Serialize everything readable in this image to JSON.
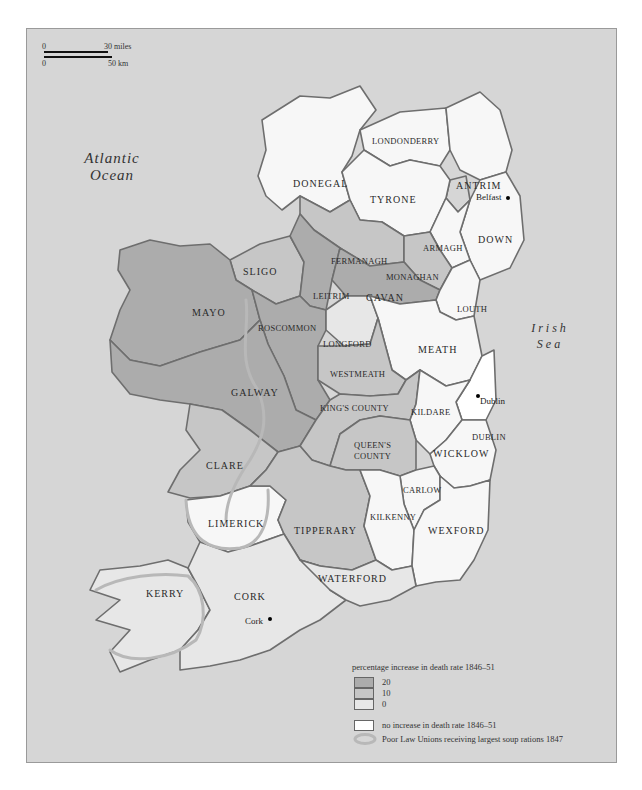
{
  "page_number": "",
  "scale_bar": {
    "zero_top": "0",
    "miles": "30 miles",
    "zero_bottom": "0",
    "km": "50 km"
  },
  "water": {
    "atlantic": "Atlantic Ocean",
    "atlantic_line1": "Atlantic",
    "atlantic_line2": "Ocean",
    "irish_line1": "Irish",
    "irish_line2": "Sea"
  },
  "colors": {
    "sea": "#d6d6d6",
    "level_20": "#acacac",
    "level_10": "#c6c6c6",
    "level_0": "#e7e7e7",
    "no_increase": "#f7f7f7",
    "border": "#6e6e6e",
    "soup_outline": "#b8b8b8"
  },
  "counties": [
    {
      "name": "DONEGAL",
      "level": "no increase"
    },
    {
      "name": "LONDONDERRY",
      "level": "no increase"
    },
    {
      "name": "ANTRIM",
      "level": "no increase"
    },
    {
      "name": "TYRONE",
      "level": "no increase"
    },
    {
      "name": "DOWN",
      "level": "no increase"
    },
    {
      "name": "ARMAGH",
      "level": "no increase"
    },
    {
      "name": "FERMANAGH",
      "level": "10"
    },
    {
      "name": "MONAGHAN",
      "level": "10"
    },
    {
      "name": "SLIGO",
      "level": "10"
    },
    {
      "name": "LEITRIM",
      "level": "20"
    },
    {
      "name": "CAVAN",
      "level": "20"
    },
    {
      "name": "MAYO",
      "level": "20"
    },
    {
      "name": "ROSCOMMON",
      "level": "20"
    },
    {
      "name": "LOUTH",
      "level": "no increase"
    },
    {
      "name": "LONGFORD",
      "level": "0"
    },
    {
      "name": "MEATH",
      "level": "no increase"
    },
    {
      "name": "WESTMEATH",
      "level": "10"
    },
    {
      "name": "GALWAY",
      "level": "20"
    },
    {
      "name": "DUBLIN",
      "level": "no increase"
    },
    {
      "name": "KING'S COUNTY",
      "level": "10"
    },
    {
      "name": "KILDARE",
      "level": "no increase"
    },
    {
      "name": "CLARE",
      "level": "10"
    },
    {
      "name": "QUEEN'S COUNTY",
      "level": "10"
    },
    {
      "name": "WICKLOW",
      "level": "no increase"
    },
    {
      "name": "CARLOW",
      "level": "no increase"
    },
    {
      "name": "LIMERICK",
      "level": "no increase"
    },
    {
      "name": "TIPPERARY",
      "level": "10"
    },
    {
      "name": "KILKENNY",
      "level": "no increase"
    },
    {
      "name": "WEXFORD",
      "level": "no increase"
    },
    {
      "name": "KERRY",
      "level": "0"
    },
    {
      "name": "CORK",
      "level": "0"
    },
    {
      "name": "WATERFORD",
      "level": "0"
    }
  ],
  "labels": {
    "donegal": "DONEGAL",
    "londonderry": "LONDONDERRY",
    "antrim": "ANTRIM",
    "tyrone": "TYRONE",
    "down": "DOWN",
    "armagh": "ARMAGH",
    "fermanagh": "FERMANAGH",
    "monaghan": "MONAGHAN",
    "sligo": "SLIGO",
    "leitrim": "LEITRIM",
    "cavan": "CAVAN",
    "mayo": "MAYO",
    "roscommon": "ROSCOMMON",
    "louth": "LOUTH",
    "longford": "LONGFORD",
    "meath": "MEATH",
    "westmeath": "WESTMEATH",
    "galway": "GALWAY",
    "dublin": "DUBLIN",
    "kings_county": "KING'S COUNTY",
    "kildare": "KILDARE",
    "clare": "CLARE",
    "queens_line1": "QUEEN'S",
    "queens_line2": "COUNTY",
    "wicklow": "WICKLOW",
    "carlow": "CARLOW",
    "limerick": "LIMERICK",
    "tipperary": "TIPPERARY",
    "kilkenny": "KILKENNY",
    "wexford": "WEXFORD",
    "kerry": "KERRY",
    "cork": "CORK",
    "waterford": "WATERFORD"
  },
  "towns": {
    "belfast": "Belfast",
    "dublin": "Dublin",
    "cork": "Cork"
  },
  "legend": {
    "title": "percentage increase in death rate 1846–51",
    "levels": [
      "20",
      "10",
      "0"
    ],
    "no_increase": "no increase in death rate 1846–51",
    "soup": "Poor Law Unions receiving largest soup rations 1847"
  }
}
